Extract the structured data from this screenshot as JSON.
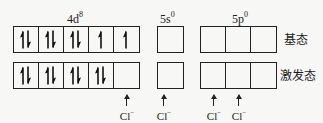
{
  "diagram": {
    "orbitals": [
      {
        "name": "4d",
        "superscript": "8",
        "boxes": 5
      },
      {
        "name": "5s",
        "superscript": "0",
        "boxes": 1
      },
      {
        "name": "5p",
        "superscript": "0",
        "boxes": 3
      }
    ],
    "states": {
      "ground": {
        "label": "基态",
        "4d": [
          "paired",
          "paired",
          "paired",
          "up",
          "up"
        ],
        "5s": [
          "empty"
        ],
        "5p": [
          "empty",
          "empty",
          "empty"
        ]
      },
      "excited": {
        "label": "激发态",
        "4d": [
          "paired",
          "paired",
          "paired",
          "paired",
          "empty"
        ],
        "5s": [
          "empty"
        ],
        "5p": [
          "empty",
          "empty",
          "empty"
        ]
      }
    },
    "ligand": {
      "symbol": "Cl",
      "charge": "−",
      "positions": [
        "4d box 5",
        "5s box 1",
        "5p box 1",
        "5p box 2"
      ]
    }
  }
}
